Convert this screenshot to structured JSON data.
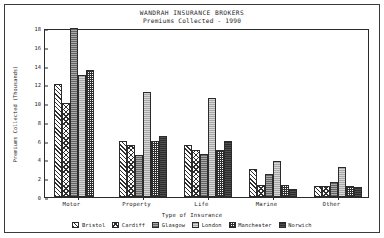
{
  "figure": {
    "title_main": "WANDRAH INSURANCE BROKERS",
    "title_sub": "Premiums Collected - 1990"
  },
  "chart_data": {
    "type": "bar",
    "title": "WANDRAH INSURANCE BROKERS",
    "subtitle": "Premiums Collected - 1990",
    "xlabel": "Type of Insurance",
    "ylabel": "Premiums Collected (Thousands)",
    "categories": [
      "Motor",
      "Property",
      "Life",
      "Marine",
      "Other"
    ],
    "ylim": [
      0,
      18
    ],
    "yticks": [
      0,
      2,
      4,
      6,
      8,
      10,
      12,
      14,
      16,
      18
    ],
    "grid": false,
    "legend_position": "bottom",
    "series": [
      {
        "name": "Bristol",
        "color": "#ffffff",
        "pattern": "diagonal-hatch",
        "values": [
          12.0,
          6.0,
          5.5,
          3.0,
          1.2
        ]
      },
      {
        "name": "Cardiff",
        "color": "#ffffff",
        "pattern": "cross-diagonal-hatch",
        "values": [
          10.0,
          5.5,
          5.0,
          1.3,
          1.2
        ]
      },
      {
        "name": "Glasgow",
        "color": "#8d8d8d",
        "pattern": "dense-gray",
        "values": [
          18.0,
          4.5,
          4.6,
          2.4,
          1.6
        ]
      },
      {
        "name": "London",
        "color": "#b6b6b6",
        "pattern": "light-gray",
        "values": [
          13.0,
          11.2,
          10.5,
          3.8,
          3.2
        ]
      },
      {
        "name": "Manchester",
        "color": "#ffffff",
        "pattern": "checkerboard",
        "values": [
          13.5,
          6.0,
          5.0,
          1.3,
          1.2
        ]
      },
      {
        "name": "Norwich",
        "color": "#3b3b3b",
        "pattern": "solid-dark",
        "values": [
          0.0,
          6.5,
          6.0,
          0.9,
          1.1
        ]
      }
    ]
  }
}
